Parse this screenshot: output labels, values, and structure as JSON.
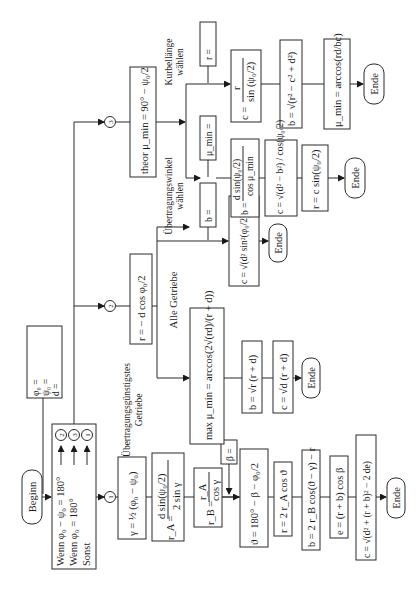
{
  "diagram": {
    "orientation": "rotated-90-ccw",
    "start": {
      "label": "Beginn"
    },
    "inputs": {
      "lines": [
        "φ₀ =",
        "ψ₀ =",
        "d ="
      ]
    },
    "decision": {
      "lines": [
        "Wenn φ₀ − ψ₀ = 180°",
        "Wenn φ₀ = 180°",
        "Sonst"
      ],
      "targets": [
        "2",
        "3",
        "1"
      ]
    },
    "branch1": {
      "marker": "1",
      "gamma": "γ = ½ (φ₀ − ψ₀)",
      "rA": "r_A = d sin(ψ₀/2) / (2 sin γ)",
      "rA_num": "d sin(ψ₀/2)",
      "rA_den": "2 sin γ",
      "rA_lhs": "r_A =",
      "rB_lhs": "r_B =",
      "rB_num": "r_A",
      "rB_den": "cos γ",
      "beta_input": "β =",
      "theta": "ϑ = 180° − β − φ₀/2",
      "r": "r = 2 r_A cos ϑ",
      "b": "b = 2 r_B cos(ϑ − γ) − r",
      "e": "e = (r + b) cos β",
      "c": "c = √(d² + (r + b)² − 2 de)",
      "end": "Ende"
    },
    "branch2": {
      "marker": "2",
      "r": "r = − d cos φ₀/2",
      "label_all": "Alle Getriebe",
      "label_best": "Übertragungsgünstigstes Getriebe",
      "b_input": "b =",
      "c_all": "c = √(d² sin²(φ₀/2) + b²)",
      "end_all": "Ende",
      "mu_max": "max μ_min = arccos(2√(rd)/(r + d))",
      "b_best": "b = √r (r + d)",
      "c_best": "c = √d (r + d)",
      "end_best": "Ende"
    },
    "branch3": {
      "marker": "3",
      "theor": "theor μ_min = 90° − ψ₀/2",
      "label_mu": "Übertragungswinkel wählen",
      "label_crank": "Kurbellänge wählen",
      "mu_input": "μ_min =",
      "b_mu": "b = d sin(ψ₀/2) / cos μ_min",
      "c_mu": "c = √(d² − b²) / cos(ψ₀/2)",
      "r_mu": "r = c sin(ψ₀/2)",
      "end_mu": "Ende",
      "r_input": "r =",
      "c_crank": "c = r / sin(ψ₀/2)",
      "b_crank": "b = √(r² − c² + d²)",
      "mu_crank": "μ_min = arccos(rd/bc)",
      "end_crank": "Ende"
    }
  }
}
